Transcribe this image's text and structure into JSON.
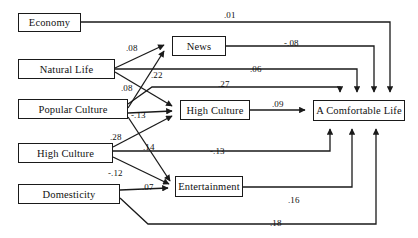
{
  "diagram": {
    "type": "path-diagram",
    "colors": {
      "line": "#1a1a1a",
      "box_border": "#1a1a1a",
      "background": "#ffffff",
      "text": "#111111"
    },
    "nodes": [
      {
        "id": "economy",
        "label": "Economy",
        "x": 18,
        "y": 13,
        "w": 63,
        "h": 19
      },
      {
        "id": "natural_life",
        "label": "Natural Life",
        "x": 18,
        "y": 59,
        "w": 97,
        "h": 20
      },
      {
        "id": "popular_culture",
        "label": "Popular Culture",
        "x": 18,
        "y": 99,
        "w": 110,
        "h": 20
      },
      {
        "id": "high_culture_ex",
        "label": "High Culture",
        "x": 18,
        "y": 143,
        "w": 95,
        "h": 20
      },
      {
        "id": "domesticity",
        "label": "Domesticity",
        "x": 18,
        "y": 184,
        "w": 102,
        "h": 20
      },
      {
        "id": "news",
        "label": "News",
        "x": 172,
        "y": 36,
        "w": 54,
        "h": 20
      },
      {
        "id": "high_culture_m",
        "label": "High Culture",
        "x": 180,
        "y": 100,
        "w": 70,
        "h": 20
      },
      {
        "id": "entertainment",
        "label": "Entertainment",
        "x": 175,
        "y": 176,
        "w": 68,
        "h": 21
      },
      {
        "id": "comfortable",
        "label": "A Comfortable Life",
        "x": 313,
        "y": 100,
        "w": 92,
        "h": 21
      }
    ],
    "edges": [
      {
        "from": "economy",
        "to": "comfortable",
        "coefficient": ".01",
        "label_x": 224,
        "label_y": 10
      },
      {
        "from": "natural_life",
        "to": "news",
        "coefficient": ".08",
        "label_x": 126,
        "label_y": 43
      },
      {
        "from": "natural_life",
        "to": "high_culture_m",
        "coefficient": ".08",
        "label_x": 121,
        "label_y": 83
      },
      {
        "from": "popular_culture",
        "to": "news",
        "coefficient": ".22",
        "label_x": 151,
        "label_y": 70
      },
      {
        "from": "popular_culture",
        "to": "high_culture_m",
        "coefficient": "-.13",
        "label_x": 131,
        "label_y": 110
      },
      {
        "from": "popular_culture",
        "to": "entertainment",
        "coefficient": ".14",
        "label_x": 143,
        "label_y": 142
      },
      {
        "from": "high_culture_ex",
        "to": "high_culture_m",
        "coefficient": ".28",
        "label_x": 110,
        "label_y": 132
      },
      {
        "from": "high_culture_ex",
        "to": "entertainment",
        "coefficient": "-.12",
        "label_x": 108,
        "label_y": 168
      },
      {
        "from": "domesticity",
        "to": "entertainment",
        "coefficient": ".07",
        "label_x": 142,
        "label_y": 182
      },
      {
        "from": "news",
        "to": "comfortable",
        "coefficient": "-.08",
        "label_x": 284,
        "label_y": 38
      },
      {
        "from": "natural_life",
        "to": "comfortable",
        "coefficient": ".06",
        "label_x": 250,
        "label_y": 64
      },
      {
        "from": "popular_culture",
        "to": "comfortable",
        "coefficient": ".27",
        "label_x": 218,
        "label_y": 79
      },
      {
        "from": "high_culture_m",
        "to": "comfortable",
        "coefficient": ".09",
        "label_x": 272,
        "label_y": 99
      },
      {
        "from": "high_culture_ex",
        "to": "comfortable",
        "coefficient": "-.13",
        "label_x": 210,
        "label_y": 146
      },
      {
        "from": "entertainment",
        "to": "comfortable",
        "coefficient": ".16",
        "label_x": 288,
        "label_y": 195
      },
      {
        "from": "domesticity",
        "to": "comfortable",
        "coefficient": ".18",
        "label_x": 270,
        "label_y": 218
      }
    ]
  }
}
